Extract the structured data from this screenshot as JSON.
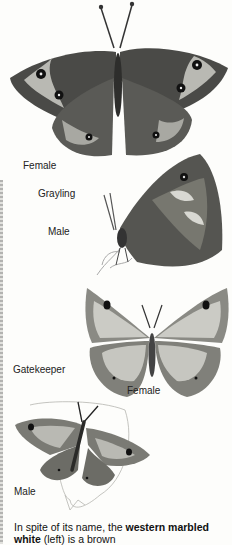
{
  "figures": [
    {
      "id": "top",
      "species": "",
      "labels": [
        "Female"
      ]
    },
    {
      "id": "grayling",
      "species": "Grayling",
      "labels": [
        "Male"
      ]
    },
    {
      "id": "gatekeeper-female",
      "species": "Gatekeeper",
      "labels": [
        "Female"
      ]
    },
    {
      "id": "gatekeeper-male",
      "species": "",
      "labels": [
        "Male"
      ]
    }
  ],
  "labels": {
    "female_top": "Female",
    "grayling": "Grayling",
    "male_grayling": "Male",
    "gatekeeper": "Gatekeeper",
    "female_gatekeeper": "Female",
    "male_gatekeeper": "Male"
  },
  "caption": {
    "part1": "In spite of its name, the ",
    "bold1": "western marbled white",
    "part2": " (left) is a brown"
  },
  "colors": {
    "paper": "#fdfdfb",
    "wing_dark": "#3a3a38",
    "wing_mid": "#7a7a76",
    "wing_light": "#cfcfca"
  }
}
